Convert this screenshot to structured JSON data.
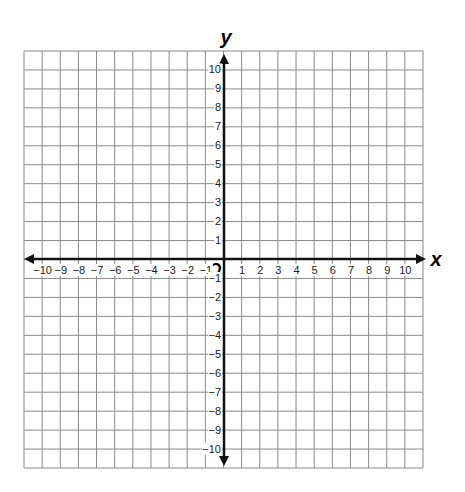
{
  "axes": {
    "x_label": "x",
    "y_label": "y",
    "origin_label": "O",
    "x_ticks": [
      "−10",
      "−9",
      "−8",
      "−7",
      "−6",
      "−5",
      "−4",
      "−3",
      "−2",
      "−1",
      "1",
      "2",
      "3",
      "4",
      "5",
      "6",
      "7",
      "8",
      "9",
      "10"
    ],
    "y_ticks_positive": [
      "10",
      "9",
      "8",
      "7",
      "6",
      "5",
      "4",
      "3",
      "2",
      "1"
    ],
    "y_ticks_negative": [
      "−1",
      "−2",
      "−3",
      "−4",
      "−5",
      "−6",
      "−7",
      "−8",
      "−9",
      "−10"
    ]
  },
  "grid": {
    "columns": 22,
    "rows": 22,
    "line_color": "#8a8a8a",
    "axis_color": "#111111"
  }
}
